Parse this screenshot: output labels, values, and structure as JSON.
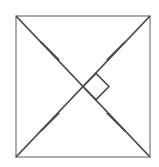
{
  "figure": {
    "title": "Square with diagonals, congruence tick marks, and right angle marker",
    "type": "geometry-diagram",
    "shape": "square",
    "background_color": "#ffffff",
    "stroke_color": "#4a4a4a",
    "outline_color": "#8a8a8a",
    "canvas": {
      "width": 159,
      "height": 167
    },
    "square": {
      "name": "square-outline",
      "left": 16,
      "top": 16,
      "right": 150,
      "bottom": 157,
      "stroke_width": 1.4,
      "fill": "#ffffff"
    },
    "diagonals": [
      {
        "name": "diagonal-top-left-to-bottom-right",
        "x1": 16,
        "y1": 16,
        "x2": 150,
        "y2": 157,
        "stroke_width": 1.8
      },
      {
        "name": "diagonal-bottom-left-to-top-right",
        "x1": 16,
        "y1": 157,
        "x2": 150,
        "y2": 16,
        "stroke_width": 1.8
      }
    ],
    "center": {
      "x": 83,
      "y": 86.5
    },
    "tick_marks": [
      {
        "name": "tick-mark-upper-left",
        "cx": 50,
        "cy": 51,
        "angle": 45,
        "length": 26
      },
      {
        "name": "tick-mark-upper-right",
        "cx": 116,
        "cy": 51,
        "angle": -45,
        "length": 26
      },
      {
        "name": "tick-mark-lower-left",
        "cx": 50,
        "cy": 122,
        "angle": -45,
        "length": 26
      },
      {
        "name": "tick-mark-lower-right",
        "cx": 116,
        "cy": 122,
        "angle": 45,
        "length": 26
      }
    ],
    "right_angle_marker": {
      "name": "right-angle-marker",
      "points": "83,86.5 96,73.5 109,86.5 96,99.5",
      "side": "east",
      "size": 13,
      "stroke_width": 1.6
    },
    "labels": []
  }
}
